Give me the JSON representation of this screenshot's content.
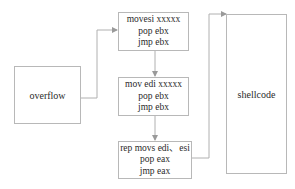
{
  "diagram": {
    "nodes": [
      {
        "id": "overflow",
        "label": "overflow"
      },
      {
        "id": "gadget1",
        "lines": [
          "movesi xxxxx",
          "pop ebx",
          "jmp ebx"
        ]
      },
      {
        "id": "gadget2",
        "lines": [
          "mov edi xxxxx",
          "pop ebx",
          "jmp ebx"
        ]
      },
      {
        "id": "gadget3",
        "lines": [
          "rep movs edi、esi",
          "pop eax",
          "jmp eax"
        ]
      },
      {
        "id": "shellcode",
        "label": "shellcode"
      }
    ],
    "edges": [
      {
        "from": "overflow",
        "to": "gadget1"
      },
      {
        "from": "gadget1",
        "to": "gadget2"
      },
      {
        "from": "gadget2",
        "to": "gadget3"
      },
      {
        "from": "gadget3",
        "to": "shellcode"
      }
    ],
    "colors": {
      "border": "#b8b8b8",
      "text": "#2a2a2a",
      "arrow": "#9a9a9a"
    }
  }
}
